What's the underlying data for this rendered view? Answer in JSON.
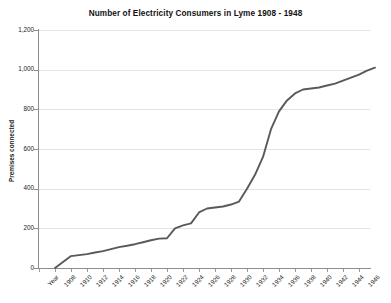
{
  "chart_data": {
    "type": "line",
    "title": "Number of Electricity Consumers in Lyme 1908 - 1948",
    "xlabel": "Year",
    "ylabel": "Premises connected",
    "ylim": [
      0,
      1200
    ],
    "yticks": [
      "0",
      "200",
      "400",
      "600",
      "800",
      "1,000",
      "1,200"
    ],
    "ytick_values": [
      0,
      200,
      400,
      600,
      800,
      1000,
      1200
    ],
    "grid": true,
    "legend": "none",
    "line_color": "#595959",
    "axis_color": "#8d8d8d",
    "grid_color": "#e3e3e3",
    "xtick_labels": [
      "Year",
      "1908",
      "1910",
      "1912",
      "1914",
      "1916",
      "1918",
      "1920",
      "1922",
      "1924",
      "1926",
      "1928",
      "1930",
      "1932",
      "1934",
      "1936",
      "1938",
      "1940",
      "1942",
      "1944",
      "1946"
    ],
    "categories": [
      1908,
      1909,
      1910,
      1911,
      1912,
      1913,
      1914,
      1915,
      1916,
      1917,
      1918,
      1919,
      1920,
      1921,
      1922,
      1923,
      1924,
      1925,
      1926,
      1927,
      1928,
      1929,
      1930,
      1931,
      1932,
      1933,
      1934,
      1935,
      1936,
      1937,
      1938,
      1939,
      1940,
      1941,
      1942,
      1943,
      1944,
      1945,
      1946,
      1947,
      1948
    ],
    "values": [
      0,
      30,
      60,
      65,
      70,
      78,
      85,
      95,
      105,
      112,
      120,
      130,
      140,
      148,
      150,
      200,
      215,
      225,
      280,
      300,
      305,
      310,
      320,
      335,
      400,
      470,
      560,
      700,
      790,
      845,
      880,
      900,
      905,
      910,
      920,
      930,
      945,
      960,
      975,
      995,
      1010
    ]
  }
}
